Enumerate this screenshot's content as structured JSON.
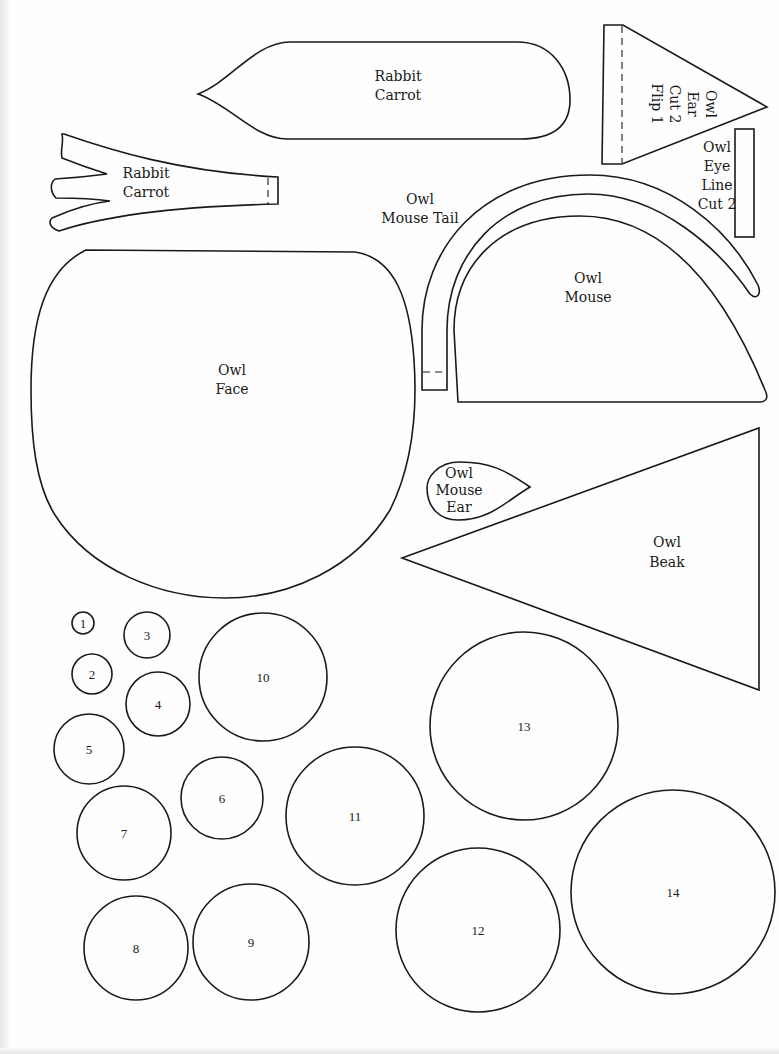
{
  "pieces": {
    "rabbit_carrot_body": {
      "lines": [
        "Rabbit",
        "Carrot"
      ]
    },
    "rabbit_carrot_top": {
      "lines": [
        "Rabbit",
        "Carrot"
      ]
    },
    "owl_ear": {
      "lines": [
        "Owl",
        "Ear",
        "Cut 2",
        "Flip 1"
      ]
    },
    "owl_eye_line": {
      "lines": [
        "Owl",
        "Eye",
        "Line",
        "Cut 2"
      ]
    },
    "owl_mouse_tail": {
      "lines": [
        "Owl",
        "Mouse Tail"
      ]
    },
    "owl_mouse": {
      "lines": [
        "Owl",
        "Mouse"
      ]
    },
    "owl_face": {
      "lines": [
        "Owl",
        "Face"
      ]
    },
    "owl_mouse_ear": {
      "lines": [
        "Owl",
        "Mouse",
        "Ear"
      ]
    },
    "owl_beak": {
      "lines": [
        "Owl",
        "Beak"
      ]
    }
  },
  "circles": [
    {
      "label": "1",
      "cx": 83,
      "cy": 623,
      "r": 11
    },
    {
      "label": "2",
      "cx": 92,
      "cy": 674,
      "r": 20
    },
    {
      "label": "3",
      "cx": 147,
      "cy": 635,
      "r": 23
    },
    {
      "label": "4",
      "cx": 158,
      "cy": 704,
      "r": 32
    },
    {
      "label": "5",
      "cx": 89,
      "cy": 749,
      "r": 35
    },
    {
      "label": "6",
      "cx": 222,
      "cy": 798,
      "r": 41
    },
    {
      "label": "7",
      "cx": 124,
      "cy": 833,
      "r": 47
    },
    {
      "label": "8",
      "cx": 136,
      "cy": 948,
      "r": 52
    },
    {
      "label": "9",
      "cx": 251,
      "cy": 942,
      "r": 58
    },
    {
      "label": "10",
      "cx": 263,
      "cy": 677,
      "r": 64
    },
    {
      "label": "11",
      "cx": 355,
      "cy": 816,
      "r": 69
    },
    {
      "label": "12",
      "cx": 478,
      "cy": 930,
      "r": 82
    },
    {
      "label": "13",
      "cx": 524,
      "cy": 726,
      "r": 94
    },
    {
      "label": "14",
      "cx": 673,
      "cy": 892,
      "r": 102
    }
  ]
}
